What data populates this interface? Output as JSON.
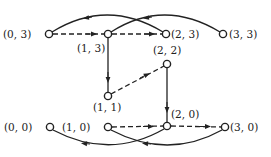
{
  "diagram": {
    "type": "state-transition-graph",
    "nodes": [
      {
        "id": "n03",
        "label": "(0, 3)",
        "x": 49,
        "y": 34,
        "lx": 3,
        "ly": 38
      },
      {
        "id": "n13",
        "label": "(1, 3)",
        "x": 108,
        "y": 34,
        "lx": 77,
        "ly": 52
      },
      {
        "id": "n23",
        "label": "(2, 3)",
        "x": 166,
        "y": 34,
        "lx": 171,
        "ly": 38
      },
      {
        "id": "n33",
        "label": "(3, 3)",
        "x": 223,
        "y": 34,
        "lx": 229,
        "ly": 38
      },
      {
        "id": "n22",
        "label": "(2, 2)",
        "x": 167,
        "y": 64,
        "lx": 153,
        "ly": 54
      },
      {
        "id": "n11",
        "label": "(1, 1)",
        "x": 108,
        "y": 96,
        "lx": 93,
        "ly": 111
      },
      {
        "id": "n00",
        "label": "(0, 0)",
        "x": 50,
        "y": 127,
        "lx": 4,
        "ly": 131
      },
      {
        "id": "n10",
        "label": "(1, 0)",
        "x": 108,
        "y": 127,
        "lx": 62,
        "ly": 131
      },
      {
        "id": "n20",
        "label": "(2, 0)",
        "x": 167,
        "y": 126,
        "lx": 171,
        "ly": 118
      },
      {
        "id": "n30",
        "label": "(3, 0)",
        "x": 225,
        "y": 127,
        "lx": 230,
        "ly": 131
      }
    ],
    "edges": [
      {
        "from": "(0, 3)",
        "to": "(1, 3)",
        "style": "dashed"
      },
      {
        "from": "(1, 3)",
        "to": "(2, 3)",
        "style": "dashed"
      },
      {
        "from": "(2, 3)",
        "to": "(0, 3)",
        "style": "solid-arc"
      },
      {
        "from": "(3, 3)",
        "to": "(1, 3)",
        "style": "solid-arc"
      },
      {
        "from": "(1, 3)",
        "to": "(1, 1)",
        "style": "solid"
      },
      {
        "from": "(1, 1)",
        "to": "(2, 2)",
        "style": "dashed"
      },
      {
        "from": "(2, 2)",
        "to": "(2, 0)",
        "style": "solid"
      },
      {
        "from": "(1, 0)",
        "to": "(2, 0)",
        "style": "dashed"
      },
      {
        "from": "(2, 0)",
        "to": "(3, 0)",
        "style": "dashed"
      },
      {
        "from": "(2, 0)",
        "to": "(0, 0)",
        "style": "solid-arc"
      },
      {
        "from": "(3, 0)",
        "to": "(1, 0)",
        "style": "solid-arc"
      }
    ]
  }
}
